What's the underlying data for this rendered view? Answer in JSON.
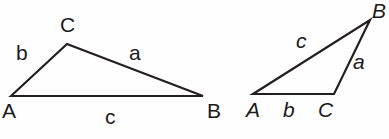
{
  "figure": {
    "background_color": "#fefefe",
    "stroke_color": "#231f20",
    "text_color": "#1c1a1b",
    "width": 389,
    "height": 139
  },
  "left_triangle": {
    "name": "obtuse-triangle-upright-labels",
    "style": "upright",
    "vertices": [
      {
        "label": "A",
        "x": 11,
        "y": 96
      },
      {
        "label": "C",
        "x": 67,
        "y": 44
      },
      {
        "label": "B",
        "x": 203,
        "y": 96
      }
    ],
    "vertex_labels": [
      {
        "label": "A",
        "x": 2,
        "y": 100
      },
      {
        "label": "C",
        "x": 60,
        "y": 14
      },
      {
        "label": "B",
        "x": 207,
        "y": 100
      }
    ],
    "side_labels": [
      {
        "label": "b",
        "x": 16,
        "y": 42,
        "between": "A-C"
      },
      {
        "label": "a",
        "x": 129,
        "y": 42,
        "between": "C-B"
      },
      {
        "label": "c",
        "x": 105,
        "y": 106,
        "between": "A-B"
      }
    ]
  },
  "right_triangle": {
    "name": "obtuse-triangle-italic-labels",
    "style": "italic",
    "vertices": [
      {
        "label": "A",
        "x": 253,
        "y": 94
      },
      {
        "label": "C",
        "x": 334,
        "y": 94
      },
      {
        "label": "B",
        "x": 370,
        "y": 20
      }
    ],
    "vertex_labels": [
      {
        "label": "A",
        "x": 246,
        "y": 99
      },
      {
        "label": "C",
        "x": 318,
        "y": 99
      },
      {
        "label": "B",
        "x": 372,
        "y": 0
      }
    ],
    "side_labels": [
      {
        "label": "c",
        "x": 296,
        "y": 30,
        "between": "A-B"
      },
      {
        "label": "a",
        "x": 353,
        "y": 51,
        "between": "C-B"
      },
      {
        "label": "b",
        "x": 283,
        "y": 99,
        "between": "A-C"
      }
    ]
  }
}
